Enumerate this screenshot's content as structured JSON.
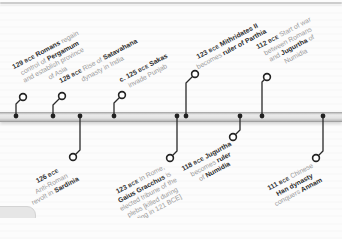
{
  "page": {
    "background_color": "#fbfbfb",
    "top_rule_color": "#cdcdcd"
  },
  "timeline": {
    "bar": {
      "y": 112,
      "height": 10,
      "fill_light": "#ebebeb",
      "edge_top": "#9f9f9f",
      "edge_bottom": "#8f8f8f"
    },
    "marker_color": "#222222",
    "text_strong_color": "#2d2d2d",
    "text_muted_color": "#9a9a9a"
  },
  "corner_button": {
    "shape": "partial-pill",
    "color": "#e6e6e6"
  },
  "events": [
    {
      "id": "129-bce-pergamum",
      "year": "129",
      "era": "BCE",
      "side": "top",
      "dot": {
        "x": 16,
        "y": 116
      },
      "elbow_y": 104,
      "circle": {
        "x": 23,
        "y": 97
      },
      "anchor": {
        "left": 27,
        "bottom": 124
      },
      "lines": [
        [
          {
            "t": "129",
            "c": "yr"
          },
          {
            "t": "BCE",
            "c": "bce"
          },
          {
            "t": "Romans",
            "c": "b"
          },
          {
            "t": "regain",
            "c": "n"
          }
        ],
        [
          {
            "t": "control of",
            "c": "n"
          },
          {
            "t": "Pergamum",
            "c": "b"
          }
        ],
        [
          {
            "t": "and establish province",
            "c": "n"
          }
        ],
        [
          {
            "t": "of Asia",
            "c": "n"
          }
        ]
      ]
    },
    {
      "id": "128-bce-satavahana",
      "year": "128",
      "era": "BCE",
      "side": "top",
      "dot": {
        "x": 53,
        "y": 116
      },
      "elbow_y": 105,
      "circle": {
        "x": 62,
        "y": 96
      },
      "anchor": {
        "left": 66,
        "bottom": 125
      },
      "lines": [
        [
          {
            "t": "128",
            "c": "yr"
          },
          {
            "t": "BCE",
            "c": "bce"
          },
          {
            "t": "Rise of",
            "c": "n"
          },
          {
            "t": "Satavahana",
            "c": "b"
          }
        ],
        [
          {
            "t": "dynasty in India",
            "c": "n"
          }
        ]
      ]
    },
    {
      "id": "c-125-bce-sakas",
      "year": "c. 125",
      "era": "BCE",
      "side": "top",
      "dot": {
        "x": 114,
        "y": 116
      },
      "elbow_y": 103,
      "circle": {
        "x": 122,
        "y": 95
      },
      "anchor": {
        "left": 126,
        "bottom": 126
      },
      "lines": [
        [
          {
            "t": "c. 125",
            "c": "yr"
          },
          {
            "t": "BCE",
            "c": "bce"
          },
          {
            "t": "Sakas",
            "c": "b"
          }
        ],
        [
          {
            "t": "invade Punjab",
            "c": "n"
          }
        ]
      ]
    },
    {
      "id": "123-bce-mithridates",
      "year": "123",
      "era": "BCE",
      "side": "top",
      "dot": {
        "x": 186,
        "y": 116
      },
      "elbow_y": 83,
      "circle": {
        "x": 195,
        "y": 74
      },
      "anchor": {
        "left": 199,
        "bottom": 147
      },
      "lines": [
        [
          {
            "t": "123",
            "c": "yr"
          },
          {
            "t": "BCE",
            "c": "bce"
          },
          {
            "t": "Mithridates II",
            "c": "b"
          }
        ],
        [
          {
            "t": "becomes",
            "c": "n"
          },
          {
            "t": "ruler of Parthia",
            "c": "b"
          }
        ]
      ]
    },
    {
      "id": "112-bce-jugurthine-war",
      "year": "112",
      "era": "BCE",
      "side": "top",
      "dot": {
        "x": 262,
        "y": 116
      },
      "elbow_y": 82,
      "circle": {
        "x": 267,
        "y": 77
      },
      "anchor": {
        "left": 271,
        "bottom": 144
      },
      "lines": [
        [
          {
            "t": "112",
            "c": "yr"
          },
          {
            "t": "BCE",
            "c": "bce"
          },
          {
            "t": "Start of war",
            "c": "n"
          }
        ],
        [
          {
            "t": "between Romans",
            "c": "n"
          }
        ],
        [
          {
            "t": "and",
            "c": "n"
          },
          {
            "t": "Jugurtha",
            "c": "b"
          },
          {
            "t": "of",
            "c": "n"
          }
        ],
        [
          {
            "t": "Numidia",
            "c": "n"
          }
        ]
      ]
    },
    {
      "id": "126-bce-sardinia",
      "year": "126",
      "era": "BCE",
      "side": "bottom",
      "dot": {
        "x": 80,
        "y": 116
      },
      "elbow_y": 150,
      "circle": {
        "x": 73,
        "y": 157
      },
      "anchor": {
        "right": 273,
        "top": 160
      },
      "lines": [
        [
          {
            "t": "126",
            "c": "yr"
          },
          {
            "t": "BCE",
            "c": "bce"
          }
        ],
        [
          {
            "t": "Anti-Roman",
            "c": "n"
          }
        ],
        [
          {
            "t": "revolt in",
            "c": "n"
          },
          {
            "t": "Sardinia",
            "c": "b"
          }
        ]
      ]
    },
    {
      "id": "123-bce-gracchus",
      "year": "123",
      "era": "BCE",
      "side": "bottom",
      "dot": {
        "x": 177,
        "y": 116
      },
      "elbow_y": 151,
      "circle": {
        "x": 170,
        "y": 158
      },
      "anchor": {
        "right": 176,
        "top": 161
      },
      "lines": [
        [
          {
            "t": "123",
            "c": "yr"
          },
          {
            "t": "BCE",
            "c": "bce"
          },
          {
            "t": "In Rome,",
            "c": "n"
          }
        ],
        [
          {
            "t": "Gaius Gracchus",
            "c": "b"
          },
          {
            "t": "is",
            "c": "n"
          }
        ],
        [
          {
            "t": "elected tribune of the",
            "c": "n"
          }
        ],
        [
          {
            "t": "plebs [killed during",
            "c": "n"
          }
        ],
        [
          {
            "t": "rioting in 121 BCE]",
            "c": "n"
          }
        ]
      ]
    },
    {
      "id": "118-bce-jugurtha-numidia",
      "year": "118",
      "era": "BCE",
      "side": "bottom",
      "dot": {
        "x": 240,
        "y": 116
      },
      "elbow_y": 130,
      "circle": {
        "x": 233,
        "y": 137
      },
      "anchor": {
        "right": 113,
        "top": 140
      },
      "lines": [
        [
          {
            "t": "118",
            "c": "yr"
          },
          {
            "t": "BCE",
            "c": "bce"
          },
          {
            "t": "Jugurtha",
            "c": "b"
          }
        ],
        [
          {
            "t": "becomes",
            "c": "n"
          },
          {
            "t": "ruler",
            "c": "b"
          }
        ],
        [
          {
            "t": "of",
            "c": "n"
          },
          {
            "t": "Numidia",
            "c": "b"
          }
        ]
      ]
    },
    {
      "id": "111-bce-han-annam",
      "year": "111",
      "era": "BCE",
      "side": "bottom",
      "dot": {
        "x": 323,
        "y": 116
      },
      "elbow_y": 151,
      "circle": {
        "x": 316,
        "y": 158
      },
      "anchor": {
        "right": 30,
        "top": 161
      },
      "lines": [
        [
          {
            "t": "111",
            "c": "yr"
          },
          {
            "t": "BCE",
            "c": "bce"
          },
          {
            "t": "Chinese",
            "c": "n"
          }
        ],
        [
          {
            "t": "Han dynasty",
            "c": "b"
          }
        ],
        [
          {
            "t": "conquers",
            "c": "n"
          },
          {
            "t": "Annam",
            "c": "b"
          }
        ]
      ]
    }
  ]
}
